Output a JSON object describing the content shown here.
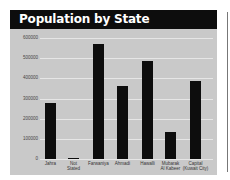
{
  "chart_data": {
    "type": "bar",
    "title": "Population by State",
    "xlabel": "",
    "ylabel": "",
    "categories": [
      "Jahra",
      "Not Stated",
      "Farwaniya",
      "Ahmadi",
      "Hawalli",
      "Mubarak Al Kabeer",
      "Capital (Kuwait City)"
    ],
    "category_labels": [
      [
        "Jahra"
      ],
      [
        "Not",
        "Stated"
      ],
      [
        "Farwaniya"
      ],
      [
        "Ahmadi"
      ],
      [
        "Hawalli"
      ],
      [
        "Mubarak",
        "Al Kabeer"
      ],
      [
        "Capital",
        "(Kuwait City)"
      ]
    ],
    "values": [
      280000,
      5000,
      570000,
      360000,
      485000,
      135000,
      385000
    ],
    "ylim": [
      0,
      600000
    ],
    "yticks": [
      "0",
      "100000",
      "200000",
      "300000",
      "400000",
      "500000",
      "600000"
    ],
    "grid": true,
    "legend": null,
    "colors": {
      "bar": "#0d0d0d",
      "background": "#c9c9c9",
      "title_bar": "#0d0d0d",
      "title_text": "#ffffff",
      "grid": "#e6e6e6"
    }
  }
}
